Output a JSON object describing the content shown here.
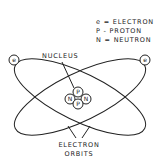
{
  "diagram": {
    "type": "atom-model",
    "legend": [
      {
        "symbol": "e",
        "label": "e = ELECTRON"
      },
      {
        "symbol": "P",
        "label": "P - PROTON"
      },
      {
        "symbol": "N",
        "label": "N = NEUTRON"
      }
    ],
    "labels": {
      "nucleus": "NUCLEUS",
      "orbits_line1": "ELECTRON",
      "orbits_line2": "ORBITS"
    },
    "nucleus_particles": [
      "P",
      "N",
      "N",
      "P"
    ],
    "electrons": [
      "e",
      "e"
    ],
    "stroke_color": "#222222"
  }
}
